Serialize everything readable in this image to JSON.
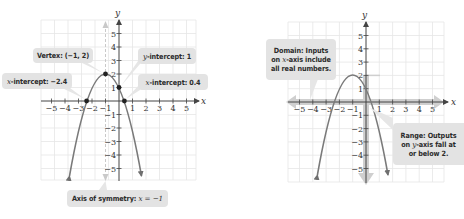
{
  "left_graph": {
    "axis_labels": {
      "x": "x",
      "y": "y"
    },
    "x_ticks": [
      "−5",
      "−4",
      "−3",
      "−2",
      "−1",
      "1",
      "2",
      "3",
      "4",
      "5"
    ],
    "y_ticks": [
      "5",
      "4",
      "3",
      "2",
      "1",
      "−1",
      "−2",
      "−3",
      "−4",
      "−5"
    ],
    "callouts": {
      "vertex": "Vertex: (−1, 2)",
      "y_intercept_prefix": "y",
      "y_intercept_rest": "-intercept: 1",
      "x_intercept_left_prefix": "x",
      "x_intercept_left_rest": "-intercept: −2.4",
      "x_intercept_right_prefix": "x",
      "x_intercept_right_rest": "-intercept: 0.4",
      "axis_symmetry_label": "Axis of symmetry: ",
      "axis_symmetry_eq": "x = −1"
    }
  },
  "right_graph": {
    "axis_labels": {
      "x": "x",
      "y": "y"
    },
    "x_ticks": [
      "−5",
      "−4",
      "−3",
      "−2",
      "−1",
      "1",
      "2",
      "3",
      "4",
      "5"
    ],
    "y_ticks": [
      "5",
      "4",
      "3",
      "2",
      "1",
      "−1",
      "−2",
      "−3",
      "−4",
      "−5"
    ],
    "callouts": {
      "domain_line1": "Domain: Inputs",
      "domain_line2_pre": "on ",
      "domain_line2_var": "x",
      "domain_line2_post": "-axis include",
      "domain_line3": "all real numbers.",
      "range_line1": "Range: Outputs",
      "range_line2_pre": "on ",
      "range_line2_var": "y",
      "range_line2_post": "-axis fall at",
      "range_line3": "or below 2."
    }
  },
  "function": {
    "expression": "f(x) = -(x+1)^2 + 2",
    "vertex": [
      -1,
      2
    ],
    "y_intercept": 1,
    "x_intercepts": [
      -2.4,
      0.4
    ],
    "axis_of_symmetry": -1,
    "domain": "all real numbers",
    "range": "y <= 2"
  },
  "colors": {
    "curve": "#7a7a7a",
    "grid": "#e6e6e6",
    "axis": "#555555",
    "callout_bg": "#e3e3e3",
    "highlight_arrow": "#c8c8c8"
  }
}
